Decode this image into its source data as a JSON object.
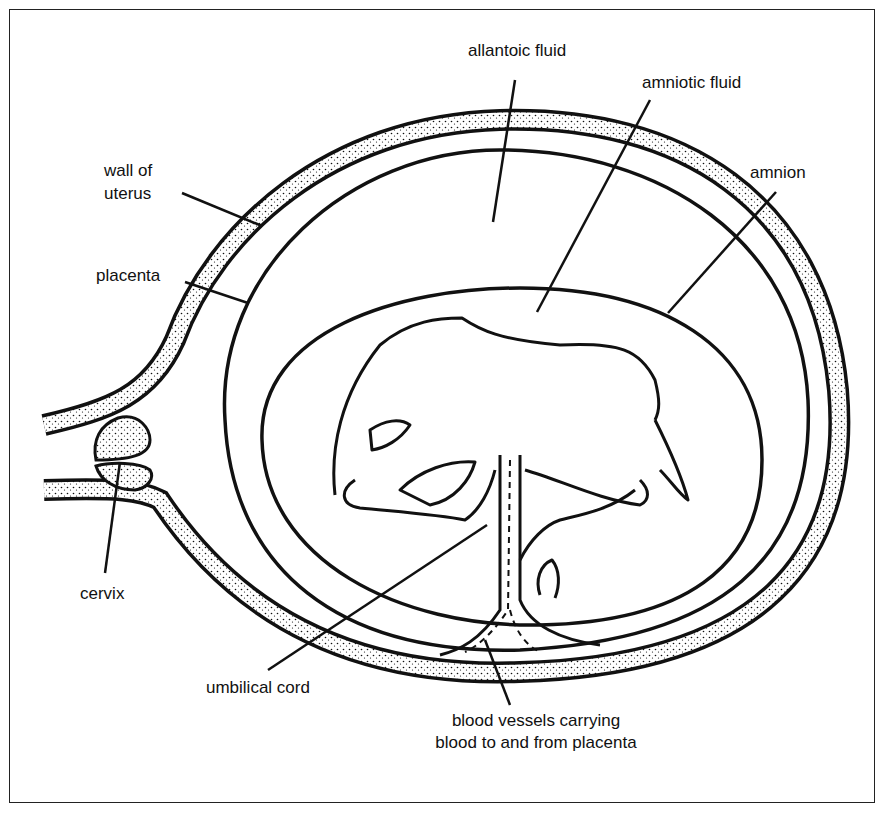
{
  "diagram": {
    "colors": {
      "line": "#111111",
      "background": "#ffffff",
      "stipple": "#111111"
    },
    "labels": {
      "allantoic_fluid": "allantoic fluid",
      "amniotic_fluid": "amniotic fluid",
      "amnion": "amnion",
      "wall_of_uterus_line1": "wall of",
      "wall_of_uterus_line2": "uterus",
      "placenta": "placenta",
      "cervix": "cervix",
      "umbilical_cord": "umbilical cord",
      "blood_vessels_line1": "blood vessels carrying",
      "blood_vessels_line2": "blood to and from placenta"
    }
  }
}
